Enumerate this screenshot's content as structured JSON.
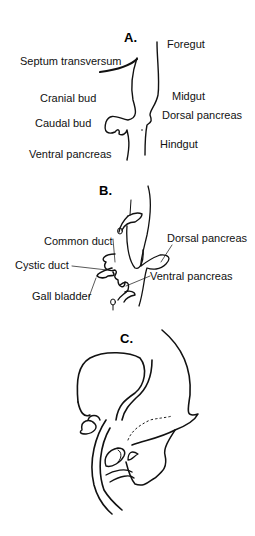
{
  "panels": {
    "a": {
      "title": "A.",
      "labels": {
        "foregut": "Foregut",
        "septum_transversum": "Septum transversum",
        "midgut": "Midgut",
        "cranial_bud": "Cranial bud",
        "dorsal_pancreas": "Dorsal pancreas",
        "caudal_bud": "Caudal bud",
        "hindgut": "Hindgut",
        "ventral_pancreas": "Ventral pancreas"
      }
    },
    "b": {
      "title": "B.",
      "labels": {
        "common_duct": "Common duct",
        "dorsal_pancreas": "Dorsal pancreas",
        "cystic_duct": "Cystic duct",
        "ventral_pancreas": "Ventral pancreas",
        "gall_bladder": "Gall bladder"
      }
    },
    "c": {
      "title": "C."
    }
  },
  "colors": {
    "line": "#111111",
    "background": "#ffffff"
  }
}
